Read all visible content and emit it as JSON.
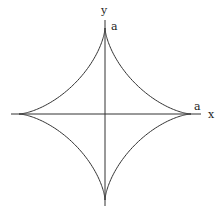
{
  "diagram": {
    "type": "astroid",
    "axes": {
      "x_label": "x",
      "y_label": "y"
    },
    "intercepts": {
      "x_label": "a",
      "y_label": "a"
    },
    "colors": {
      "stroke": "#333333",
      "background": "#ffffff"
    }
  }
}
